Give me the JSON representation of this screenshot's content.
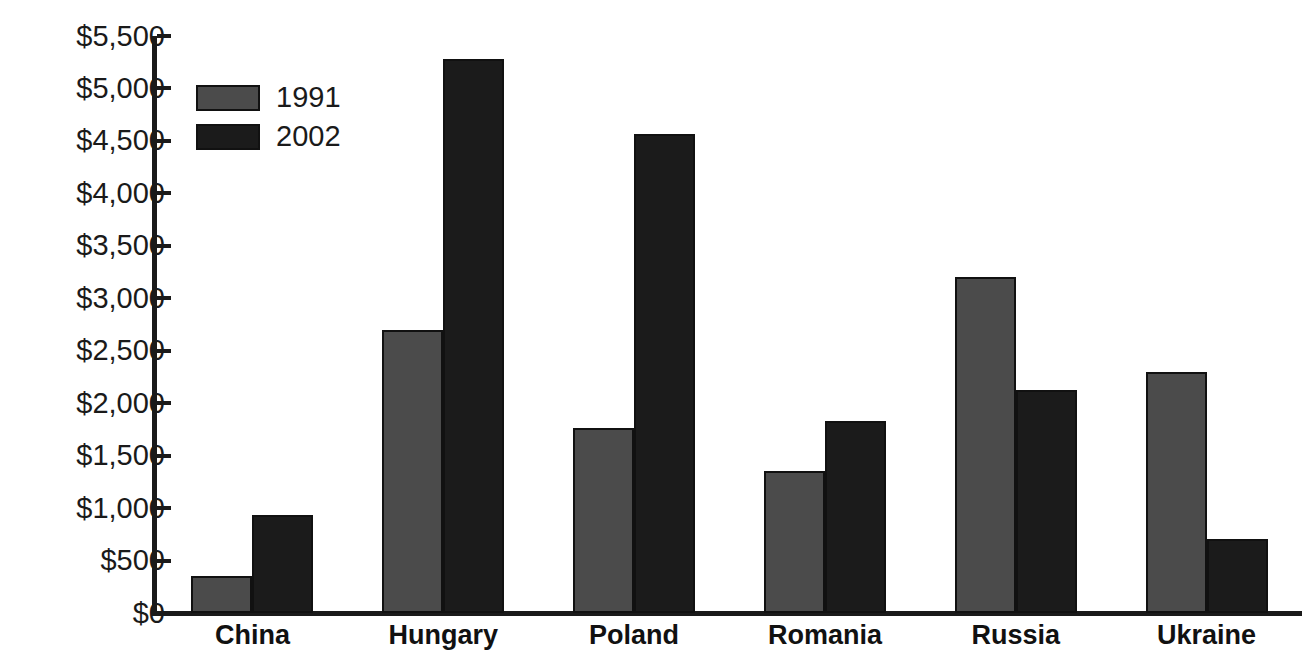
{
  "chart_data": {
    "type": "bar",
    "title": "",
    "subtitle": "",
    "xlabel": "",
    "ylabel": "",
    "categories": [
      "China",
      "Hungary",
      "Poland",
      "Romania",
      "Russia",
      "Ukraine"
    ],
    "series": [
      {
        "name": "1991",
        "color": "#4b4b4b",
        "values": [
          350,
          2700,
          1760,
          1350,
          3200,
          2300
        ]
      },
      {
        "name": "2002",
        "color": "#1b1b1b",
        "values": [
          930,
          5280,
          4570,
          1830,
          2130,
          710
        ]
      }
    ],
    "ylim": [
      0,
      5500
    ],
    "ytick_values": [
      0,
      500,
      1000,
      1500,
      2000,
      2500,
      3000,
      3500,
      4000,
      4500,
      5000,
      5500
    ],
    "ytick_labels": [
      "$0",
      "$500",
      "$1,000",
      "$1,500",
      "$2,000",
      "$2,500",
      "$3,000",
      "$3,500",
      "$4,000",
      "$4,500",
      "$5,000",
      "$5,500"
    ],
    "grid": false,
    "legend_position": "upper-left",
    "legend_entries": [
      "1991",
      "2002"
    ],
    "annotations": []
  }
}
